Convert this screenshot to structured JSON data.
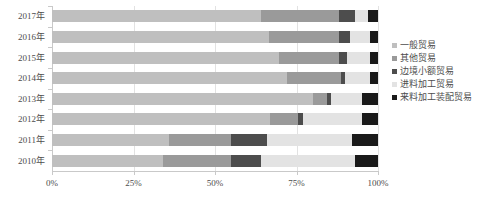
{
  "chart_data": {
    "type": "bar",
    "orientation": "horizontal",
    "stacked": true,
    "normalized": true,
    "title": "",
    "subtitle": "",
    "xlabel": "",
    "ylabel": "",
    "xlim": [
      0,
      100
    ],
    "xticks": [
      0,
      25,
      50,
      75,
      100
    ],
    "xticklabels": [
      "0%",
      "25%",
      "50%",
      "75%",
      "100%"
    ],
    "grid": true,
    "grid_axis": "x",
    "legend_position": "right",
    "categories": [
      "2017年",
      "2016年",
      "2015年",
      "2014年",
      "2013年",
      "2012年",
      "2011年",
      "2010年"
    ],
    "series": [
      {
        "name": "一般贸易",
        "color": "#bfbfbf",
        "values": [
          64.0,
          66.5,
          69.5,
          72.0,
          80.0,
          67.0,
          36.0,
          34.0
        ]
      },
      {
        "name": "其他贸易",
        "color": "#9a9a9a",
        "values": [
          24.0,
          21.5,
          18.5,
          16.5,
          4.5,
          8.5,
          19.0,
          21.0
        ]
      },
      {
        "name": "边境小额贸易",
        "color": "#4d4d4d",
        "values": [
          5.0,
          3.5,
          2.5,
          1.5,
          1.0,
          1.5,
          11.0,
          9.0
        ]
      },
      {
        "name": "进料加工贸易",
        "color": "#e3e3e3",
        "values": [
          4.0,
          6.0,
          7.0,
          7.5,
          9.5,
          18.0,
          26.0,
          29.0
        ]
      },
      {
        "name": "来料加工装配贸易",
        "color": "#1a1a1a",
        "values": [
          3.0,
          2.5,
          2.5,
          2.5,
          5.0,
          5.0,
          8.0,
          7.0
        ]
      }
    ]
  }
}
